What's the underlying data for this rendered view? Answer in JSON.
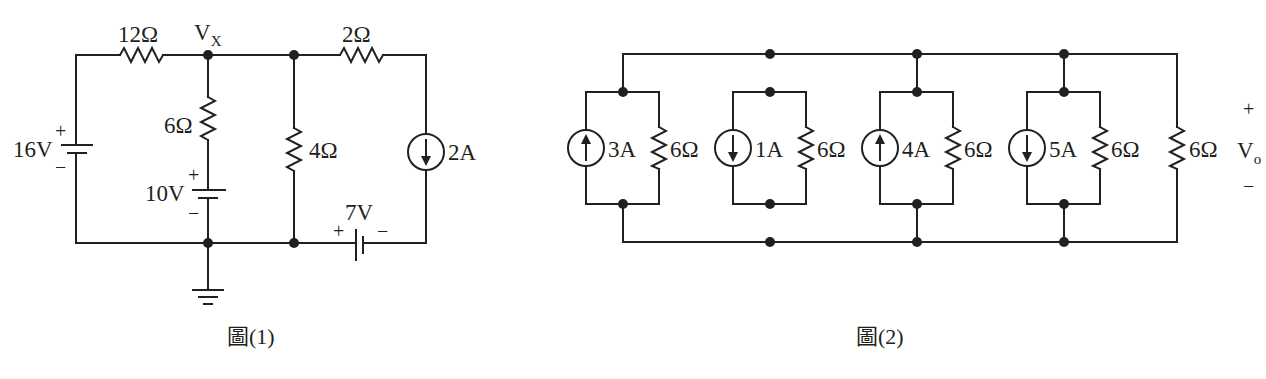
{
  "figure1": {
    "caption": "圖(1)",
    "node_label": "V",
    "node_label_sub": "X",
    "components": {
      "r12": "12Ω",
      "r2": "2Ω",
      "r6": "6Ω",
      "r4": "4Ω",
      "v16": "16V",
      "v10": "10V",
      "v7": "7V",
      "i2": "2A"
    },
    "signs": {
      "plus": "+",
      "minus": "−"
    }
  },
  "figure2": {
    "caption": "圖(2)",
    "output_label": "V",
    "output_label_sub": "o",
    "groups": [
      {
        "source": "3A",
        "direction": "up",
        "resistor": "6Ω"
      },
      {
        "source": "1A",
        "direction": "down",
        "resistor": "6Ω"
      },
      {
        "source": "4A",
        "direction": "up",
        "resistor": "6Ω"
      },
      {
        "source": "5A",
        "direction": "down",
        "resistor": "6Ω"
      }
    ],
    "load_resistor": "6Ω",
    "signs": {
      "plus": "+",
      "minus": "−"
    }
  }
}
